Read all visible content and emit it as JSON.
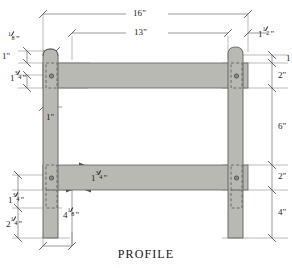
{
  "drawing": {
    "title": "PROFILE",
    "type": "technical-woodworking-profile",
    "colors": {
      "wood_fill": "#b9b9b4",
      "wood_edge": "#6c6c68",
      "line": "#6e6e6e",
      "text": "#1b1b1b",
      "background": "#ffffff"
    },
    "dimensions": {
      "overall_width": {
        "label": "16\"",
        "whole": "16",
        "unit": "\""
      },
      "inner_width": {
        "label": "13\"",
        "whole": "13",
        "unit": "\""
      },
      "post_top_offset_left": {
        "whole": "",
        "num": "1",
        "den": "8",
        "unit": "\""
      },
      "post_top_offset_right": {
        "whole": "1",
        "num": "1",
        "den": "2",
        "unit": "\""
      },
      "top_rail_top": {
        "label": "1\"",
        "whole": "1",
        "unit": "\""
      },
      "top_rail_right_edge": {
        "label": "1",
        "whole": "1",
        "unit": ""
      },
      "top_tenon_height": {
        "whole": "1",
        "num": "3",
        "den": "4",
        "unit": "\""
      },
      "top_rail_thickness_right": {
        "label": "2\"",
        "whole": "2",
        "unit": "\""
      },
      "tenon_inset": {
        "label": "1\"",
        "whole": "1",
        "unit": "\""
      },
      "rail_gap": {
        "label": "6\"",
        "whole": "6",
        "unit": "\""
      },
      "lower_rail_thickness": {
        "whole": "1",
        "num": "3",
        "den": "4",
        "unit": "\""
      },
      "lower_rail_thickness_right": {
        "label": "2\"",
        "whole": "2",
        "unit": "\""
      },
      "lower_mortise_height": {
        "whole": "1",
        "num": "3",
        "den": "4",
        "unit": "\""
      },
      "post_bottom_left": {
        "whole": "2",
        "num": "1",
        "den": "4",
        "unit": "\""
      },
      "rail_to_bottom": {
        "whole": "4",
        "num": "1",
        "den": "8",
        "unit": "\""
      },
      "post_bottom_right": {
        "label": "4\"",
        "whole": "4",
        "unit": "\""
      }
    },
    "parts": [
      {
        "name": "left-post",
        "kind": "post"
      },
      {
        "name": "right-post",
        "kind": "post"
      },
      {
        "name": "upper-rail",
        "kind": "rail"
      },
      {
        "name": "lower-rail",
        "kind": "rail"
      }
    ],
    "joinery": [
      {
        "name": "upper-left-joint",
        "peg": true,
        "mortise": true
      },
      {
        "name": "upper-right-joint",
        "peg": true,
        "mortise": true
      },
      {
        "name": "lower-left-joint",
        "peg": true,
        "mortise": true
      },
      {
        "name": "lower-right-joint",
        "peg": true,
        "mortise": true
      }
    ]
  }
}
